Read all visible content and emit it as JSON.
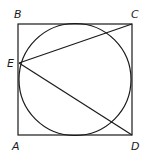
{
  "diagram": {
    "stroke_color": "#1a1a1a",
    "background": "#ffffff",
    "square": {
      "x": 18,
      "y": 24,
      "width": 114,
      "height": 111
    },
    "circle": {
      "cx": 75,
      "cy": 79.5,
      "r": 56
    },
    "points": {
      "A": {
        "label": "A",
        "x": 18,
        "y": 135
      },
      "B": {
        "label": "B",
        "x": 18,
        "y": 24
      },
      "C": {
        "label": "C",
        "x": 132,
        "y": 24
      },
      "D": {
        "label": "D",
        "x": 132,
        "y": 135
      },
      "E": {
        "label": "E",
        "x": 19,
        "y": 63
      }
    },
    "segments": [
      {
        "from": "E",
        "to": "C"
      },
      {
        "from": "E",
        "to": "D"
      }
    ],
    "labels": [
      {
        "text": "B",
        "x": 16,
        "y": 18
      },
      {
        "text": "C",
        "x": 132,
        "y": 18
      },
      {
        "text": "E",
        "x": 7,
        "y": 67
      },
      {
        "text": "A",
        "x": 13,
        "y": 150
      },
      {
        "text": "D",
        "x": 132,
        "y": 150
      }
    ]
  }
}
